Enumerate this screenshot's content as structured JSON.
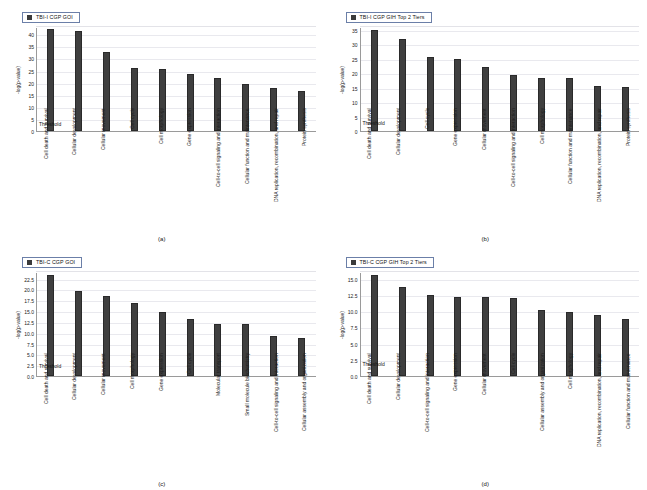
{
  "figure": {
    "accent_color": "#3f3f3f",
    "legend_border_color": "#6b7fa8",
    "threshold_label": "Threshold",
    "ylabel": "-log(p-value)"
  },
  "panels": [
    {
      "caption": "(a)",
      "legend": "TBI-I CGP GOI",
      "chart_data": {
        "type": "bar",
        "title": "TBI-I CGP GOI",
        "xlabel": "",
        "ylabel": "-log(p-value)",
        "ylim": [
          0,
          43
        ],
        "yticks": [
          "0",
          "5",
          "10",
          "15",
          "20",
          "25",
          "30",
          "35",
          "40"
        ],
        "grid": true,
        "legend_position": "top-left",
        "threshold": 1.3,
        "categories": [
          "Cell death and survival",
          "Cellular development",
          "Cellular movement",
          "Cell cycle",
          "Cell morphology",
          "Gene expression",
          "Cell-to-cell signaling and interaction",
          "Cellular function and maintenance",
          "DNA replication, recombination, and repair",
          "Protein synthesis"
        ],
        "values": [
          42.0,
          41.5,
          32.5,
          26.0,
          25.5,
          23.5,
          21.8,
          19.5,
          17.8,
          16.5
        ]
      }
    },
    {
      "caption": "(b)",
      "legend": "TBI-I CGP GIH Top 2 Tiers",
      "chart_data": {
        "type": "bar",
        "title": "TBI-I CGP GIH Top 2 Tiers",
        "xlabel": "",
        "ylabel": "-log(p-value)",
        "ylim": [
          0,
          36
        ],
        "yticks": [
          "0",
          "5",
          "10",
          "15",
          "20",
          "25",
          "30",
          "35"
        ],
        "grid": true,
        "legend_position": "top-left",
        "threshold": 1.3,
        "categories": [
          "Cell death and survival",
          "Cellular development",
          "Cell cycle",
          "Gene expression",
          "Cellular movement",
          "Cell-to-cell signaling and interaction",
          "Cell morphology",
          "Cellular function and maintenance",
          "DNA replication, recombination, and repair",
          "Protein synthesis"
        ],
        "values": [
          34.8,
          31.7,
          25.6,
          25.1,
          22.2,
          19.3,
          18.3,
          18.2,
          15.6,
          15.4
        ]
      }
    },
    {
      "caption": "(c)",
      "legend": "TBI-C CGP GOI",
      "chart_data": {
        "type": "bar",
        "title": "TBI-C CGP GOI",
        "xlabel": "",
        "ylabel": "-log(p-value)",
        "ylim": [
          0,
          24
        ],
        "yticks": [
          "0.0",
          "2.5",
          "5.0",
          "7.5",
          "10.0",
          "12.5",
          "15.0",
          "17.5",
          "20.0",
          "22.5"
        ],
        "grid": true,
        "legend_position": "top-left",
        "threshold": 1.3,
        "categories": [
          "Cell death and survival",
          "Cellular development",
          "Cellular movement",
          "Cell morphology",
          "Gene expression",
          "Cell cycle",
          "Molecular transport",
          "Small molecule biochemistry",
          "Cell-to-cell signaling and interaction",
          "Cellular assembly and organization"
        ],
        "values": [
          23.4,
          19.7,
          18.5,
          16.8,
          14.8,
          13.1,
          12.0,
          12.0,
          9.2,
          8.8
        ]
      }
    },
    {
      "caption": "(d)",
      "legend": "TBI-C CGP GIH Top 2 Tiers",
      "chart_data": {
        "type": "bar",
        "title": "TBI-C CGP GIH Top 2 Tiers",
        "xlabel": "",
        "ylabel": "-log(p-value)",
        "ylim": [
          0,
          16
        ],
        "yticks": [
          "0.0",
          "2.5",
          "5.0",
          "7.5",
          "10.0",
          "12.5",
          "15.0"
        ],
        "grid": true,
        "legend_position": "top-left",
        "threshold": 1.3,
        "categories": [
          "Cell death and survival",
          "Cellular development",
          "Cell-to-cell signaling and interaction",
          "Gene expression",
          "Cellular movement",
          "Cell cycle",
          "Cellular assembly and organization",
          "Cell morphology",
          "DNA replication, recombination, and repair",
          "Cellular function and maintenance"
        ],
        "values": [
          15.5,
          13.7,
          12.4,
          12.1,
          12.1,
          12.0,
          10.1,
          9.9,
          9.4,
          8.8
        ]
      }
    }
  ]
}
